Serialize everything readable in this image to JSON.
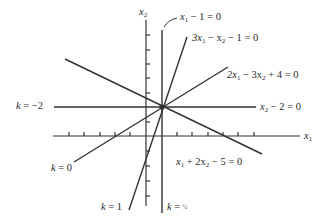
{
  "diagram": {
    "type": "pencil-of-lines",
    "axes": {
      "x_label": "x₁",
      "y_label": "x₂"
    },
    "intersection_point": {
      "x1": 1,
      "x2": 2
    },
    "lines": [
      {
        "id": "l1",
        "equation": "x₁ − 1 = 0",
        "k_label": "k = ½"
      },
      {
        "id": "l2",
        "equation": "3x₁ − x₂ − 1 = 0",
        "k_label": "k = 1"
      },
      {
        "id": "l3",
        "equation": "2x₁ − 3x₂ + 4 = 0",
        "k_label": "k = 0"
      },
      {
        "id": "l4",
        "equation": "x₂ − 2 = 0",
        "k_label": "k = −2"
      },
      {
        "id": "l5",
        "equation": "x₁ + 2x₂ − 5 = 0",
        "k_label": ""
      }
    ]
  },
  "labels": {
    "x2_axis": "x",
    "x2_sub": "2",
    "x1_axis": "x",
    "x1_sub": "1",
    "eq_vertical": {
      "a": "x",
      "a_sub": "1",
      "rest": " − 1 = 0"
    },
    "eq_steep": {
      "a": "3x",
      "a_sub": "1",
      "b": " − x",
      "b_sub": "2",
      "rest": " − 1 = 0"
    },
    "eq_shallow": {
      "a": "2x",
      "a_sub": "1",
      "b": " − 3x",
      "b_sub": "2",
      "rest": " + 4 = 0"
    },
    "eq_horizontal": {
      "a": "x",
      "a_sub": "2",
      "rest": " − 2 = 0"
    },
    "eq_negative": {
      "a": "x",
      "a_sub": "1",
      "b": " + 2x",
      "b_sub": "2",
      "rest": " − 5 = 0"
    },
    "k_neg2": {
      "k": "k",
      "rest": " = −2"
    },
    "k_0": {
      "k": "k",
      "rest": " = 0"
    },
    "k_1": {
      "k": "k",
      "rest": " = 1"
    },
    "k_half": {
      "k": "k",
      "rest": " = ",
      "frac": "½"
    }
  },
  "colors": {
    "line": "#333333",
    "text": "#2a2a2a",
    "background": "#ffffff"
  }
}
